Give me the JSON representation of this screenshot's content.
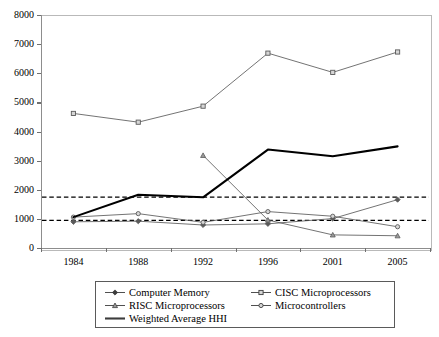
{
  "chart_data": {
    "type": "line",
    "title": "",
    "xlabel": "",
    "ylabel": "",
    "categories": [
      "1984",
      "1988",
      "1992",
      "1996",
      "2001",
      "2005"
    ],
    "ylim": [
      0,
      8000
    ],
    "yticks": [
      0,
      1000,
      2000,
      3000,
      4000,
      5000,
      6000,
      7000,
      8000
    ],
    "ytick_labels": [
      "0",
      "1000",
      "2000",
      "3000",
      "4000",
      "5000",
      "6000",
      "7000",
      "8000"
    ],
    "grid": false,
    "legend_position": "bottom",
    "series": [
      {
        "name": "Computer Memory",
        "marker": "diamond",
        "style": "solid-thin",
        "color": "#5a5a5a",
        "values": [
          900,
          920,
          790,
          830,
          1010,
          1660
        ]
      },
      {
        "name": "CISC Microprocessors",
        "marker": "square",
        "style": "solid-thin",
        "color": "#5a5a5a",
        "values": [
          4620,
          4320,
          4870,
          6690,
          6030,
          6730
        ]
      },
      {
        "name": "RISC Microprocessors",
        "marker": "triangle",
        "style": "solid-thin",
        "color": "#5a5a5a",
        "values": [
          null,
          null,
          3180,
          960,
          450,
          420
        ]
      },
      {
        "name": "Microcontrollers",
        "marker": "circle",
        "style": "solid-thin",
        "color": "#5a5a5a",
        "values": [
          1060,
          1180,
          880,
          1250,
          1090,
          730
        ]
      },
      {
        "name": "Weighted Average HHI",
        "marker": "none",
        "style": "solid-thick",
        "color": "#000000",
        "values": [
          1060,
          1830,
          1740,
          3380,
          3150,
          3490
        ]
      }
    ],
    "reference_lines": [
      {
        "name": "upper-threshold",
        "value": 1750,
        "style": "dashed",
        "color": "#000000"
      },
      {
        "name": "lower-threshold",
        "value": 950,
        "style": "dashed",
        "color": "#000000"
      }
    ],
    "axis_color": "#8d8d8d",
    "frame_color": "#b9b9b9"
  },
  "legend": {
    "rows": [
      [
        {
          "label": "Computer Memory",
          "marker": "diamond",
          "style": "solid-thin"
        },
        {
          "label": "CISC Microprocessors",
          "marker": "square",
          "style": "solid-thin"
        }
      ],
      [
        {
          "label": "RISC Microprocessors",
          "marker": "triangle",
          "style": "solid-thin"
        },
        {
          "label": "Microcontrollers",
          "marker": "circle",
          "style": "solid-thin"
        }
      ],
      [
        {
          "label": "Weighted Average HHI",
          "marker": "none",
          "style": "solid-thick"
        }
      ]
    ]
  }
}
